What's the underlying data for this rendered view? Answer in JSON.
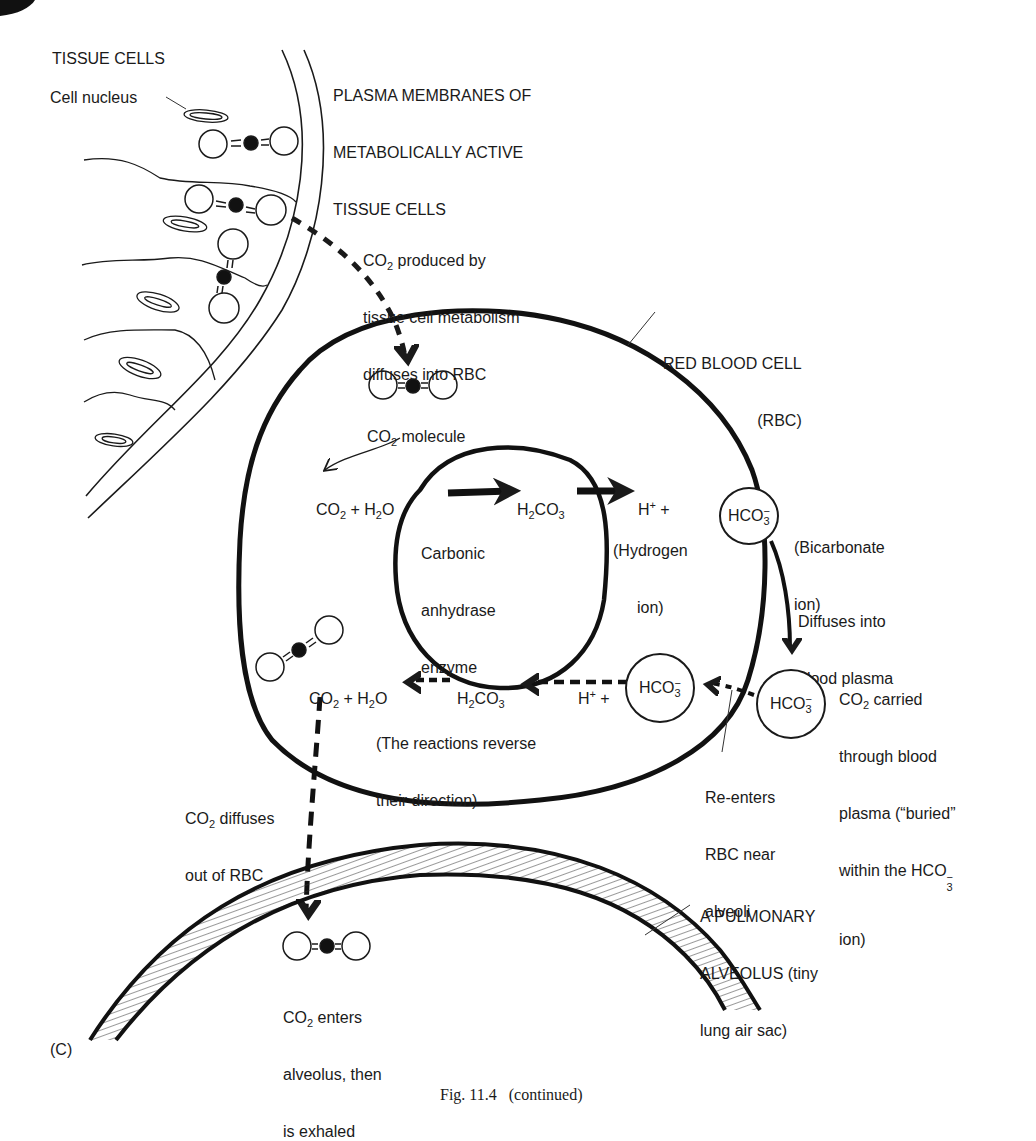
{
  "figure": {
    "panel_label": "(C)",
    "caption": "Fig. 11.4   (continued)"
  },
  "labels": {
    "tissue_cells": "TISSUE CELLS",
    "cell_nucleus": "Cell nucleus",
    "plasma_membranes": [
      "PLASMA MEMBRANES OF",
      "METABOLICALLY ACTIVE",
      "TISSUE CELLS"
    ],
    "co2_produced": [
      "CO",
      "2",
      " produced by",
      "tissue cell metabolism",
      "diffuses into RBC"
    ],
    "red_blood_cell": [
      "RED BLOOD CELL",
      "(RBC)"
    ],
    "co2_molecule": [
      "CO",
      "2",
      " molecule"
    ],
    "carbonic_anhydrase": [
      "Carbonic",
      "anhydrase",
      "enzyme"
    ],
    "hydrogen_ion": [
      "(Hydrogen",
      "ion)"
    ],
    "bicarbonate_ion": [
      "(Bicarbonate",
      "ion)"
    ],
    "diffuses_into_plasma": [
      "Diffuses into",
      "blood plasma"
    ],
    "co2_carried": [
      "CO",
      "2",
      " carried",
      "through blood",
      "plasma (“buried”",
      "within the HCO",
      "ion)"
    ],
    "re_enters": [
      "Re-enters",
      "RBC near",
      "alveoli"
    ],
    "reactions_reverse": [
      "(The reactions reverse",
      "their direction)"
    ],
    "co2_diffuses_out": [
      "CO",
      "2",
      " diffuses",
      "out of RBC"
    ],
    "pulmonary_alveolus": [
      "A PULMONARY",
      "ALVEOLUS (tiny",
      "lung air sac)"
    ],
    "co2_enters_alveolus": [
      "CO",
      "2",
      " enters",
      "alveolus, then",
      "is exhaled"
    ]
  },
  "equations": {
    "forward": {
      "reactants": [
        "CO",
        "2",
        " + H",
        "2",
        "O"
      ],
      "intermediate": [
        "H",
        "2",
        "CO",
        "3"
      ],
      "products_h": [
        "H",
        "+",
        " +"
      ]
    },
    "reverse": {
      "products": [
        "CO",
        "2",
        " + H",
        "2",
        "O"
      ],
      "intermediate": [
        "H",
        "2",
        "CO",
        "3"
      ],
      "reactants_h": [
        "H",
        "+",
        " +"
      ]
    },
    "bicarbonate": {
      "base": "HCO",
      "sub": "3",
      "sup": "−"
    }
  },
  "colors": {
    "ink": "#1a1a1a",
    "paper": "#ffffff"
  }
}
